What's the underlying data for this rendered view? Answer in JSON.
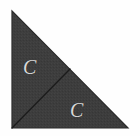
{
  "figure": {
    "name": "right-triangle-split-into-two-congruent-triangles",
    "canvas": {
      "width": 140,
      "height": 136,
      "background": "#fefefe"
    },
    "outer_triangle": {
      "name": "outer-right-triangle",
      "vertices": [
        [
          12,
          11
        ],
        [
          12,
          128
        ],
        [
          128,
          128
        ]
      ],
      "fill": "#3d3d3d",
      "stroke": "#262626",
      "stroke_width": 1.2,
      "right_angle_at": [
        12,
        128
      ]
    },
    "median_line": {
      "name": "internal-division-line",
      "from": [
        12,
        128
      ],
      "to": [
        70,
        69
      ],
      "stroke": "#1b1b1b",
      "stroke_width": 1.3,
      "description": "line from the right-angle vertex to the midpoint of the hypotenuse"
    },
    "labels": [
      {
        "id": "label-upper",
        "name": "congruence-label-upper-triangle",
        "text": "C",
        "color": "#d8d8d8",
        "x": 30,
        "y": 68,
        "region": "upper-left sub-triangle"
      },
      {
        "id": "label-lower",
        "name": "congruence-label-lower-triangle",
        "text": "C",
        "color": "#d8d8d8",
        "x": 77,
        "y": 111,
        "region": "lower-right sub-triangle"
      }
    ]
  }
}
